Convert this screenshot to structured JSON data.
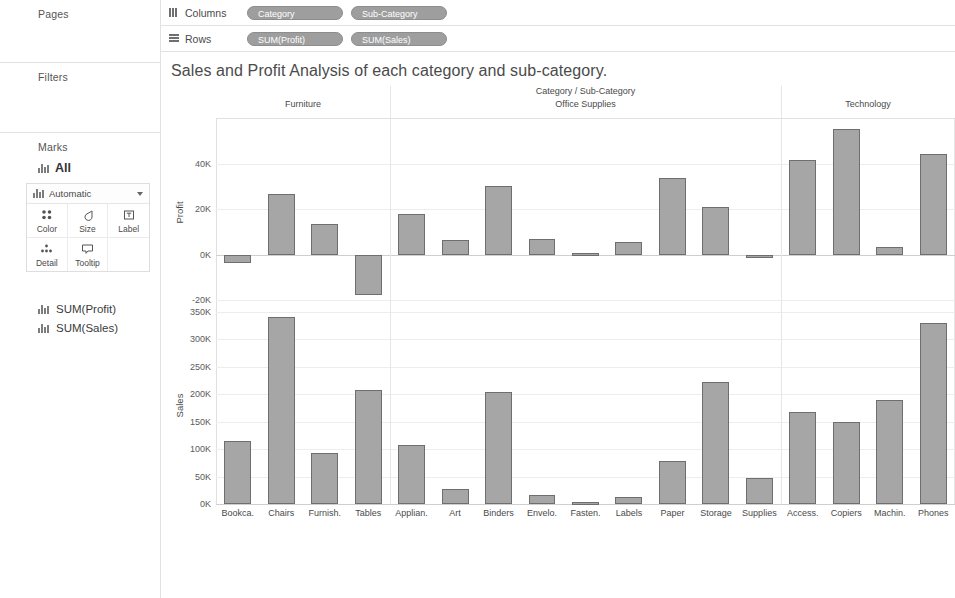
{
  "sidebar": {
    "pages_label": "Pages",
    "filters_label": "Filters",
    "marks_label": "Marks",
    "marks_all": "All",
    "mark_type": "Automatic",
    "buttons": [
      {
        "label": "Color",
        "icon": "color-dots-icon"
      },
      {
        "label": "Size",
        "icon": "size-teardrop-icon"
      },
      {
        "label": "Label",
        "icon": "label-box-icon"
      },
      {
        "label": "Detail",
        "icon": "detail-dots-icon"
      },
      {
        "label": "Tooltip",
        "icon": "tooltip-bubble-icon"
      }
    ],
    "measure_cards": [
      "SUM(Profit)",
      "SUM(Sales)"
    ]
  },
  "shelves": {
    "columns_label": "Columns",
    "rows_label": "Rows",
    "columns_pills": [
      "Category",
      "Sub-Category"
    ],
    "rows_pills": [
      "SUM(Profit)",
      "SUM(Sales)"
    ]
  },
  "viz": {
    "title": "Sales and Profit Analysis of each category and sub-category.",
    "column_header_title": "Category / Sub-Category",
    "bar_fill": "#a6a6a6",
    "bar_stroke": "#6e6e6e"
  },
  "chart_data": [
    {
      "type": "bar",
      "title": "Profit by Sub-Category",
      "ylabel": "Profit",
      "xlabel": "Category / Sub-Category",
      "ylim": [
        -24000,
        60000
      ],
      "yticks": [
        -20000,
        0,
        20000,
        40000
      ],
      "ytick_labels": [
        "-20K",
        "0K",
        "20K",
        "40K"
      ],
      "grid": true,
      "categories": [
        "Bookca.",
        "Chairs",
        "Furnish.",
        "Tables",
        "Applian.",
        "Art",
        "Binders",
        "Envelo.",
        "Fasten.",
        "Labels",
        "Paper",
        "Storage",
        "Supplies",
        "Access.",
        "Copiers",
        "Machin.",
        "Phones"
      ],
      "values": [
        -3500,
        27000,
        13500,
        -17700,
        18100,
        6500,
        30200,
        6900,
        950,
        5500,
        34000,
        21300,
        -1200,
        41900,
        55600,
        3400,
        44500
      ]
    },
    {
      "type": "bar",
      "title": "Sales by Sub-Category",
      "ylabel": "Sales",
      "xlabel": "Category / Sub-Category",
      "ylim": [
        0,
        355000
      ],
      "yticks": [
        0,
        50000,
        100000,
        150000,
        200000,
        250000,
        300000,
        350000
      ],
      "ytick_labels": [
        "0K",
        "50K",
        "100K",
        "150K",
        "200K",
        "250K",
        "300K",
        "350K"
      ],
      "grid": true,
      "categories": [
        "Bookca.",
        "Chairs",
        "Furnish.",
        "Tables",
        "Applian.",
        "Art",
        "Binders",
        "Envelo.",
        "Fasten.",
        "Labels",
        "Paper",
        "Storage",
        "Supplies",
        "Access.",
        "Copiers",
        "Machin.",
        "Phones"
      ],
      "values": [
        115000,
        340000,
        92000,
        207000,
        107000,
        27000,
        204000,
        16500,
        3000,
        12500,
        78500,
        223000,
        47000,
        167000,
        150000,
        189000,
        330000
      ]
    }
  ],
  "groups": [
    {
      "label": "Furniture",
      "start": 0,
      "end": 4
    },
    {
      "label": "Office Supplies",
      "start": 4,
      "end": 13
    },
    {
      "label": "Technology",
      "start": 13,
      "end": 17
    }
  ]
}
